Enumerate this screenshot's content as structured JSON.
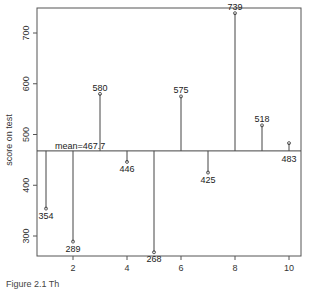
{
  "chart_data": {
    "type": "scatter",
    "subtype": "lollipop-deviation-from-mean",
    "title": "",
    "xlabel": "",
    "ylabel": "score on test",
    "x": [
      1,
      2,
      3,
      4,
      5,
      6,
      7,
      8,
      9,
      10
    ],
    "values": [
      354,
      289,
      580,
      446,
      268,
      575,
      425,
      739,
      518,
      483
    ],
    "mean": 467.7,
    "mean_label": "mean=467.7",
    "x_ticks": [
      2,
      4,
      6,
      8,
      10
    ],
    "y_ticks": [
      300,
      400,
      500,
      600,
      700
    ],
    "xlim": [
      0.6,
      10.4
    ],
    "ylim": [
      250,
      755
    ],
    "grid": false,
    "legend": null
  },
  "caption": "Figure 2.1 Th"
}
